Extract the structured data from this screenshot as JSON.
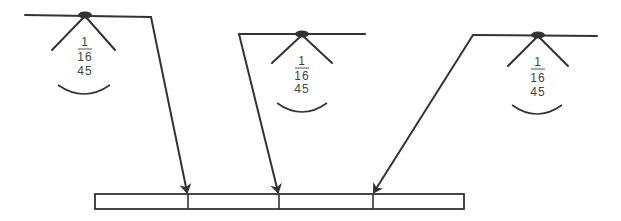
{
  "diagram": {
    "title": "",
    "lamps": [
      {
        "id": "lamp-left",
        "numerator": "1",
        "denominator": "16",
        "angle": "45"
      },
      {
        "id": "lamp-middle",
        "numerator": "1",
        "denominator": "16",
        "angle": "45"
      },
      {
        "id": "lamp-right",
        "numerator": "1",
        "denominator": "16",
        "angle": "45"
      }
    ],
    "target_bar": {
      "segments": 4
    },
    "colors": {
      "line": "#333333",
      "background": "#ffffff",
      "text": "#444444"
    }
  }
}
